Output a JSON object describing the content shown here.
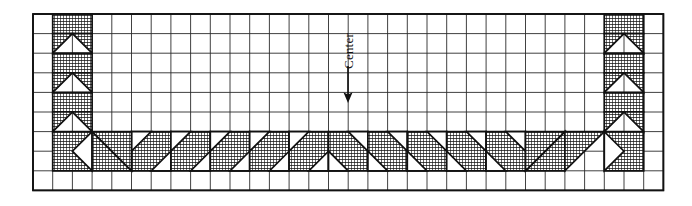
{
  "figure": {
    "kind": "quilt-block-layout-diagram",
    "annotation": {
      "label": "Center",
      "label_rotation_deg": -90,
      "arrow": "down-arrow"
    },
    "colors": {
      "ink": "#111111",
      "paper": "#ffffff",
      "grid_line": "#2b2b2b",
      "fill_hatch": "#1a1a1a"
    },
    "grid": {
      "columns": 32,
      "rows": 9,
      "x0": 33,
      "y0": 14,
      "cell_w": 19.7,
      "cell_h": 19.6,
      "line_width": 0.9
    },
    "bands": {
      "left_vertical": {
        "col_start": 1,
        "col_count": 2,
        "row_start": 0,
        "row_count": 8
      },
      "right_vertical": {
        "col_start": 29,
        "col_count": 2,
        "row_start": 0,
        "row_count": 8
      },
      "bottom_horizontal": {
        "row_start": 6,
        "row_count": 2,
        "col_start": 1,
        "col_count": 30
      }
    },
    "units": [
      {
        "c": 1,
        "r": 0,
        "w": 2,
        "h": 1,
        "type": "solid"
      },
      {
        "c": 1,
        "r": 1,
        "w": 1,
        "h": 1,
        "type": "hst",
        "dir": "tl"
      },
      {
        "c": 2,
        "r": 1,
        "w": 1,
        "h": 1,
        "type": "hst",
        "dir": "tr"
      },
      {
        "c": 1,
        "r": 2,
        "w": 2,
        "h": 1,
        "type": "solid"
      },
      {
        "c": 1,
        "r": 3,
        "w": 1,
        "h": 1,
        "type": "hst",
        "dir": "tl"
      },
      {
        "c": 2,
        "r": 3,
        "w": 1,
        "h": 1,
        "type": "hst",
        "dir": "tr"
      },
      {
        "c": 1,
        "r": 4,
        "w": 2,
        "h": 1,
        "type": "solid"
      },
      {
        "c": 1,
        "r": 5,
        "w": 1,
        "h": 1,
        "type": "hst",
        "dir": "tl"
      },
      {
        "c": 2,
        "r": 5,
        "w": 1,
        "h": 1,
        "type": "hst",
        "dir": "tr"
      },
      {
        "c": 1,
        "r": 6,
        "w": 2,
        "h": 2,
        "type": "corner-left"
      },
      {
        "c": 29,
        "r": 0,
        "w": 2,
        "h": 1,
        "type": "solid"
      },
      {
        "c": 29,
        "r": 1,
        "w": 1,
        "h": 1,
        "type": "hst",
        "dir": "tl"
      },
      {
        "c": 30,
        "r": 1,
        "w": 1,
        "h": 1,
        "type": "hst",
        "dir": "tr"
      },
      {
        "c": 29,
        "r": 2,
        "w": 2,
        "h": 1,
        "type": "solid"
      },
      {
        "c": 29,
        "r": 3,
        "w": 1,
        "h": 1,
        "type": "hst",
        "dir": "tl"
      },
      {
        "c": 30,
        "r": 3,
        "w": 1,
        "h": 1,
        "type": "hst",
        "dir": "tr"
      },
      {
        "c": 29,
        "r": 4,
        "w": 2,
        "h": 1,
        "type": "solid"
      },
      {
        "c": 29,
        "r": 5,
        "w": 1,
        "h": 1,
        "type": "hst",
        "dir": "tl"
      },
      {
        "c": 30,
        "r": 5,
        "w": 1,
        "h": 1,
        "type": "hst",
        "dir": "tr"
      },
      {
        "c": 29,
        "r": 6,
        "w": 2,
        "h": 2,
        "type": "corner-right"
      }
    ],
    "bottom_chain": {
      "left_run": {
        "col_start": 5,
        "col_end": 15,
        "unit_w": 2,
        "row": 6,
        "row_h": 2,
        "dir": "right"
      },
      "right_run": {
        "col_start": 15,
        "col_end": 25,
        "unit_w": 2,
        "row": 6,
        "row_h": 2,
        "dir": "left"
      }
    }
  }
}
